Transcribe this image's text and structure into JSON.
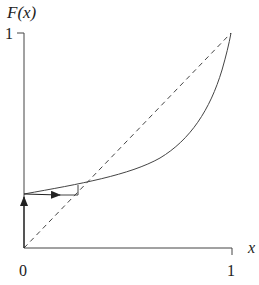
{
  "diagram": {
    "type": "cobweb-fixed-point",
    "y_axis_label": "F(x)",
    "x_axis_label": "x",
    "y_tick_labels": [
      "1"
    ],
    "x_tick_labels": [
      "0",
      "1"
    ],
    "curve": {
      "name": "F(x)",
      "description": "convex increasing curve from (0, ~0.25) to (1, 1)",
      "points": [
        [
          0,
          0.25
        ],
        [
          0.3,
          0.31
        ],
        [
          0.5,
          0.37
        ],
        [
          0.7,
          0.47
        ],
        [
          0.8,
          0.56
        ],
        [
          0.9,
          0.73
        ],
        [
          0.95,
          0.87
        ],
        [
          1.0,
          1.0
        ]
      ]
    },
    "diagonal": {
      "name": "y = x",
      "style": "dashed",
      "from": [
        0,
        0
      ],
      "to": [
        1,
        1
      ]
    },
    "fixed_point": [
      0.29,
      0.29
    ],
    "cobweb": {
      "start": [
        0,
        0
      ],
      "steps": [
        "vertical up along y-axis to F(0)",
        "horizontal right to diagonal",
        "vertical up to curve"
      ]
    },
    "colors": {
      "line": "#333333",
      "background": "#ffffff"
    }
  }
}
